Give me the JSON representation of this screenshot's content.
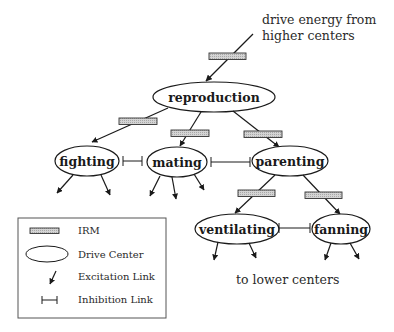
{
  "diagram": {
    "type": "behavior-hierarchy",
    "annotations": {
      "top_line1": "drive energy from",
      "top_line2": "higher centers",
      "bottom": "to lower centers"
    },
    "nodes": {
      "reproduction": "reproduction",
      "fighting": "fighting",
      "mating": "mating",
      "parenting": "parenting",
      "ventilating": "ventilating",
      "fanning": "fanning"
    },
    "edges": {
      "excitation": [
        {
          "from": "higher centers",
          "to": "reproduction",
          "via": "IRM"
        },
        {
          "from": "reproduction",
          "to": "fighting",
          "via": "IRM"
        },
        {
          "from": "reproduction",
          "to": "mating",
          "via": "IRM"
        },
        {
          "from": "reproduction",
          "to": "parenting",
          "via": "IRM"
        },
        {
          "from": "parenting",
          "to": "ventilating",
          "via": "IRM"
        },
        {
          "from": "parenting",
          "to": "fanning",
          "via": "IRM"
        }
      ],
      "inhibition": [
        {
          "between": [
            "fighting",
            "mating"
          ]
        },
        {
          "between": [
            "mating",
            "parenting"
          ]
        },
        {
          "between": [
            "ventilating",
            "fanning"
          ]
        }
      ]
    },
    "colors": {
      "line": "#1a1a1a",
      "irm_fill": "#c8c8c8",
      "background": "#ffffff"
    }
  },
  "legend": {
    "items": [
      {
        "symbol": "irm-box",
        "label": "IRM"
      },
      {
        "symbol": "ellipse",
        "label": "Drive Center"
      },
      {
        "symbol": "arrow",
        "label": "Excitation Link"
      },
      {
        "symbol": "inhibition-bar",
        "label": "Inhibition Link"
      }
    ]
  }
}
